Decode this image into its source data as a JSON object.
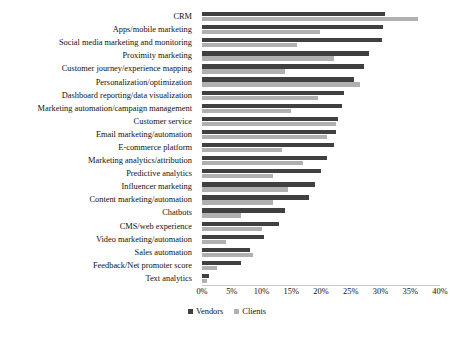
{
  "chart_data": {
    "type": "bar",
    "orientation": "horizontal",
    "title": "",
    "xlabel": "",
    "ylabel": "",
    "xlim": [
      0,
      40
    ],
    "xticks": [
      "0%",
      "5%",
      "10%",
      "15%",
      "20%",
      "25%",
      "30%",
      "35%",
      "40%"
    ],
    "xtick_values": [
      0,
      5,
      10,
      15,
      20,
      25,
      30,
      35,
      40
    ],
    "grid": false,
    "legend_position": "bottom",
    "categories": [
      "CRM",
      "Apps/mobile marketing",
      "Social media marketing and monitoring",
      "Proximity marketing",
      "Customer journey/experience mapping",
      "Personalization/optimization",
      "Dashboard reporting/data visualization",
      "Marketing automation/campaign management",
      "Customer service",
      "Email marketing/automation",
      "E-commerce platform",
      "Marketing analytics/attribution",
      "Predictive analytics",
      "Influencer marketing",
      "Content marketing/automation",
      "Chatbots",
      "CMS/web experience",
      "Video marketing/automation",
      "Sales automation",
      "Feedback/Net promoter score",
      "Text analytics"
    ],
    "series": [
      {
        "name": "Vendors",
        "color": "#404040",
        "values": [
          30.8,
          30.5,
          30.2,
          28.0,
          27.2,
          25.5,
          23.8,
          23.5,
          22.8,
          22.5,
          22.2,
          21.0,
          20.0,
          19.0,
          18.0,
          14.0,
          13.0,
          10.5,
          8.0,
          6.5,
          1.2
        ]
      },
      {
        "name": "Clients",
        "color": "#b0b0b0",
        "values": [
          36.3,
          19.8,
          16.0,
          22.2,
          14.0,
          26.5,
          19.5,
          15.0,
          22.5,
          21.0,
          13.5,
          17.0,
          12.0,
          14.5,
          12.0,
          6.5,
          10.0,
          4.0,
          8.5,
          2.5,
          0.8
        ]
      }
    ],
    "legend": [
      {
        "label": "Vendors",
        "color": "#404040"
      },
      {
        "label": "Clients",
        "color": "#b0b0b0"
      }
    ]
  }
}
